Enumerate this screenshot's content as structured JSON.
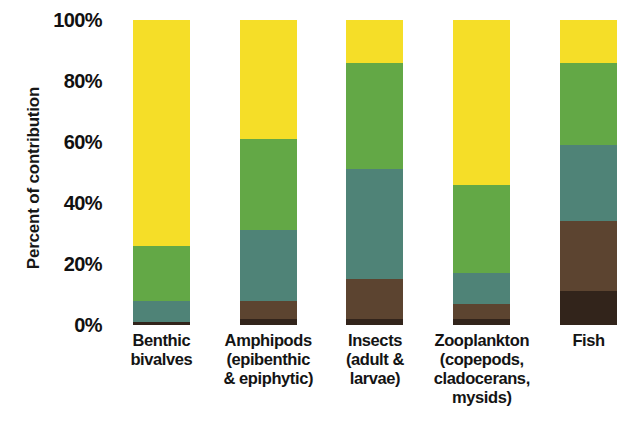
{
  "chart_data": {
    "type": "bar",
    "title": "",
    "subtitle": "",
    "xlabel": "",
    "ylabel": "Percent of contribution",
    "ylim": [
      0,
      100
    ],
    "yticks": [
      "0%",
      "20%",
      "40%",
      "60%",
      "80%",
      "100%"
    ],
    "ytick_values": [
      0,
      20,
      40,
      60,
      80,
      100
    ],
    "grid": false,
    "legend": "none",
    "stacked": true,
    "stack_order": "bottom-to-top",
    "categories": [
      "Benthic\nbivalves",
      "Amphipods\n(epibenthic\n& epiphytic)",
      "Insects\n(adult &\nlarvae)",
      "Zooplankton\n(copepods,\ncladocerans,\nmysids)",
      "Fish"
    ],
    "series": [
      {
        "name": "dark-brown-source",
        "color": "#32241B",
        "values": [
          1,
          2,
          2,
          2,
          11
        ]
      },
      {
        "name": "brown-source",
        "color": "#5C4430",
        "values": [
          0,
          6,
          13,
          5,
          23
        ]
      },
      {
        "name": "teal-source",
        "color": "#4F8377",
        "values": [
          7,
          23,
          36,
          10,
          25
        ]
      },
      {
        "name": "green-source",
        "color": "#63A846",
        "values": [
          18,
          30,
          35,
          29,
          27
        ]
      },
      {
        "name": "yellow-source",
        "color": "#F5DE28",
        "values": [
          74,
          39,
          14,
          54,
          14
        ]
      }
    ]
  },
  "axis": {
    "y_title": "Percent of contribution"
  },
  "colors": {
    "yellow": "#F5DE28",
    "green": "#63A846",
    "teal": "#4F8377",
    "brown": "#5C4430",
    "dark_brown": "#32241B",
    "background": "#FFFFFF",
    "text": "#141414"
  }
}
